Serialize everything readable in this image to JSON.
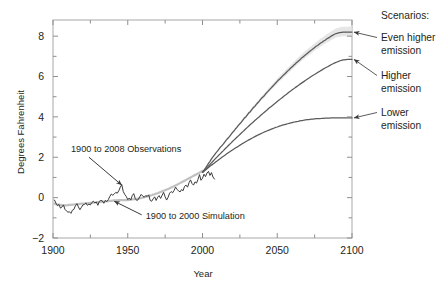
{
  "chart_data": {
    "type": "line",
    "title": "",
    "xlabel": "Year",
    "ylabel": "Degrees Fahrenheit",
    "xlim": [
      1900,
      2100
    ],
    "ylim": [
      -2,
      8.8
    ],
    "xticks": [
      1900,
      1950,
      2000,
      2050,
      2100
    ],
    "xtick_labels": [
      "1900",
      "1950",
      "2000",
      "2050",
      "2100"
    ],
    "xminor_step": 25,
    "yticks": [
      -2,
      0,
      2,
      4,
      6,
      8
    ],
    "ytick_labels": [
      "−2",
      "0",
      "2",
      "4",
      "6",
      "8"
    ],
    "yminor_step": 1,
    "grid": false,
    "legend_position": "right-outside",
    "legend_title": "Scenarios:",
    "annotations": [
      {
        "name": "observations-annotation",
        "text": "1900 to 2008 Observations",
        "text_x": 1912,
        "text_y": 2.25,
        "arrow_to_x": 1946,
        "arrow_to_y": 0.62
      },
      {
        "name": "simulation-annotation",
        "text": "1900 to 2000 Simulation",
        "text_x": 1962,
        "text_y": -1.05,
        "arrow_to_x": 1941,
        "arrow_to_y": -0.18
      }
    ],
    "series": [
      {
        "name": "observations",
        "label": "1900 to 2008 Observations",
        "color": "#3a3a3a",
        "style": "jagged-line",
        "x_start": 1901,
        "x_end": 2008,
        "values": [
          -0.12,
          -0.28,
          -0.4,
          -0.34,
          -0.52,
          -0.46,
          -0.36,
          -0.58,
          -0.66,
          -0.72,
          -0.7,
          -0.78,
          -0.62,
          -0.58,
          -0.4,
          -0.3,
          -0.46,
          -0.6,
          -0.48,
          -0.36,
          -0.34,
          -0.26,
          -0.38,
          -0.32,
          -0.36,
          -0.24,
          -0.18,
          -0.26,
          -0.22,
          -0.38,
          -0.18,
          -0.14,
          -0.16,
          -0.28,
          -0.14,
          -0.2,
          -0.1,
          0.06,
          0.18,
          0.12,
          0.18,
          0.26,
          0.22,
          0.34,
          0.52,
          0.64,
          0.3,
          0.16,
          0.06,
          -0.1,
          -0.02,
          -0.12,
          0.1,
          0.2,
          -0.04,
          -0.14,
          -0.1,
          0.04,
          0.16,
          0.08,
          0.02,
          0.1,
          0.06,
          0.14,
          -0.14,
          -0.18,
          -0.06,
          0.04,
          -0.14,
          0.02,
          0.1,
          -0.04,
          0.12,
          0.26,
          0.04,
          -0.12,
          0.02,
          0.22,
          0.3,
          0.24,
          0.36,
          0.52,
          0.4,
          0.34,
          0.28,
          0.4,
          0.34,
          0.56,
          0.62,
          0.52,
          0.74,
          0.88,
          0.7,
          0.62,
          0.78,
          0.72,
          0.9,
          1.14,
          0.86,
          0.96,
          1.16,
          1.04,
          1.22,
          1.3,
          1.1,
          1.24,
          1.02,
          0.92
        ]
      },
      {
        "name": "simulation",
        "label": "1900 to 2000 Simulation",
        "color": "#b9b9b9",
        "style": "smooth-band",
        "x_start": 1901,
        "x_end": 2000,
        "values": [
          -0.3,
          -0.32,
          -0.34,
          -0.35,
          -0.36,
          -0.37,
          -0.38,
          -0.38,
          -0.38,
          -0.37,
          -0.36,
          -0.36,
          -0.35,
          -0.34,
          -0.33,
          -0.32,
          -0.32,
          -0.31,
          -0.3,
          -0.3,
          -0.29,
          -0.28,
          -0.28,
          -0.27,
          -0.26,
          -0.26,
          -0.25,
          -0.24,
          -0.23,
          -0.22,
          -0.22,
          -0.21,
          -0.2,
          -0.2,
          -0.19,
          -0.18,
          -0.17,
          -0.16,
          -0.16,
          -0.15,
          -0.14,
          -0.14,
          -0.13,
          -0.12,
          -0.12,
          -0.12,
          -0.12,
          -0.12,
          -0.12,
          -0.12,
          -0.11,
          -0.1,
          -0.09,
          -0.08,
          -0.07,
          -0.06,
          -0.05,
          -0.04,
          -0.02,
          0.0,
          0.02,
          0.04,
          0.06,
          0.08,
          0.1,
          0.12,
          0.15,
          0.17,
          0.2,
          0.22,
          0.25,
          0.28,
          0.31,
          0.34,
          0.37,
          0.4,
          0.43,
          0.46,
          0.5,
          0.53,
          0.57,
          0.6,
          0.64,
          0.68,
          0.72,
          0.76,
          0.8,
          0.84,
          0.88,
          0.92,
          0.96,
          1.0,
          1.04,
          1.08,
          1.12,
          1.16,
          1.2,
          1.24,
          1.28,
          1.32
        ]
      },
      {
        "name": "even-higher-emission",
        "label": "Even higher emission",
        "color": "#5a5a5a",
        "style": "projection",
        "x_start": 2000,
        "x_end": 2100,
        "end_value": 8.2,
        "values": [
          1.25,
          1.36,
          1.46,
          1.58,
          1.7,
          1.8,
          1.92,
          2.02,
          2.12,
          2.22,
          2.3,
          2.4,
          2.5,
          2.58,
          2.66,
          2.76,
          2.86,
          2.94,
          3.02,
          3.12,
          3.22,
          3.3,
          3.4,
          3.48,
          3.58,
          3.66,
          3.74,
          3.84,
          3.94,
          4.0,
          4.1,
          4.2,
          4.26,
          4.36,
          4.46,
          4.52,
          4.62,
          4.7,
          4.78,
          4.88,
          4.96,
          5.02,
          5.12,
          5.2,
          5.28,
          5.36,
          5.44,
          5.52,
          5.6,
          5.68,
          5.76,
          5.84,
          5.9,
          5.98,
          6.06,
          6.12,
          6.2,
          6.28,
          6.34,
          6.42,
          6.48,
          6.56,
          6.62,
          6.7,
          6.76,
          6.82,
          6.9,
          6.96,
          7.02,
          7.08,
          7.14,
          7.2,
          7.26,
          7.32,
          7.38,
          7.44,
          7.5,
          7.54,
          7.6,
          7.66,
          7.7,
          7.76,
          7.8,
          7.86,
          7.9,
          7.94,
          8.0,
          8.04,
          8.08,
          8.12,
          8.14,
          8.16,
          8.18,
          8.19,
          8.2,
          8.2,
          8.2,
          8.2,
          8.2,
          8.2,
          8.2
        ]
      },
      {
        "name": "higher-emission",
        "label": "Higher emission",
        "color": "#5a5a5a",
        "style": "projection",
        "x_start": 2000,
        "x_end": 2100,
        "end_value": 6.85,
        "values": [
          1.25,
          1.33,
          1.41,
          1.49,
          1.57,
          1.64,
          1.72,
          1.8,
          1.88,
          1.96,
          2.03,
          2.11,
          2.18,
          2.26,
          2.33,
          2.41,
          2.48,
          2.56,
          2.63,
          2.7,
          2.78,
          2.85,
          2.92,
          2.99,
          3.06,
          3.13,
          3.2,
          3.27,
          3.34,
          3.41,
          3.48,
          3.55,
          3.62,
          3.68,
          3.75,
          3.82,
          3.88,
          3.95,
          4.01,
          4.08,
          4.14,
          4.21,
          4.27,
          4.33,
          4.4,
          4.46,
          4.52,
          4.58,
          4.64,
          4.7,
          4.76,
          4.82,
          4.88,
          4.94,
          5.0,
          5.06,
          5.11,
          5.17,
          5.23,
          5.28,
          5.34,
          5.39,
          5.45,
          5.5,
          5.55,
          5.61,
          5.66,
          5.71,
          5.76,
          5.81,
          5.86,
          5.91,
          5.96,
          6.01,
          6.06,
          6.1,
          6.15,
          6.2,
          6.24,
          6.29,
          6.33,
          6.38,
          6.42,
          6.46,
          6.5,
          6.54,
          6.58,
          6.62,
          6.66,
          6.69,
          6.72,
          6.75,
          6.78,
          6.8,
          6.82,
          6.83,
          6.84,
          6.85,
          6.85,
          6.85,
          6.85
        ]
      },
      {
        "name": "lower-emission",
        "label": "Lower emission",
        "color": "#5a5a5a",
        "style": "projection",
        "x_start": 2000,
        "x_end": 2100,
        "end_value": 3.95,
        "values": [
          1.25,
          1.31,
          1.37,
          1.43,
          1.49,
          1.55,
          1.61,
          1.66,
          1.72,
          1.78,
          1.83,
          1.89,
          1.94,
          2.0,
          2.05,
          2.1,
          2.16,
          2.21,
          2.26,
          2.31,
          2.36,
          2.41,
          2.46,
          2.5,
          2.55,
          2.6,
          2.64,
          2.69,
          2.73,
          2.78,
          2.82,
          2.86,
          2.9,
          2.94,
          2.98,
          3.02,
          3.06,
          3.1,
          3.13,
          3.17,
          3.2,
          3.24,
          3.27,
          3.3,
          3.33,
          3.36,
          3.39,
          3.42,
          3.45,
          3.48,
          3.5,
          3.53,
          3.55,
          3.58,
          3.6,
          3.62,
          3.64,
          3.66,
          3.68,
          3.7,
          3.72,
          3.74,
          3.75,
          3.77,
          3.78,
          3.8,
          3.81,
          3.82,
          3.84,
          3.85,
          3.86,
          3.87,
          3.88,
          3.89,
          3.89,
          3.9,
          3.91,
          3.91,
          3.92,
          3.92,
          3.93,
          3.93,
          3.94,
          3.94,
          3.94,
          3.94,
          3.95,
          3.95,
          3.95,
          3.95,
          3.95,
          3.95,
          3.95,
          3.95,
          3.95,
          3.95,
          3.95,
          3.95,
          3.95,
          3.95,
          3.95
        ]
      }
    ],
    "uncertainty_band": {
      "name": "even-higher-uncertainty-band",
      "color": "#e2e2e2",
      "upper_offset": 0.28,
      "lower_offset": 0.22
    }
  },
  "legend": {
    "title": "Scenarios:",
    "items": [
      {
        "label_line1": "Even higher",
        "label_line2": "emission",
        "name": "even-higher-emission"
      },
      {
        "label_line1": "Higher",
        "label_line2": "emission",
        "name": "higher-emission"
      },
      {
        "label_line1": "Lower",
        "label_line2": "emission",
        "name": "lower-emission"
      }
    ]
  }
}
